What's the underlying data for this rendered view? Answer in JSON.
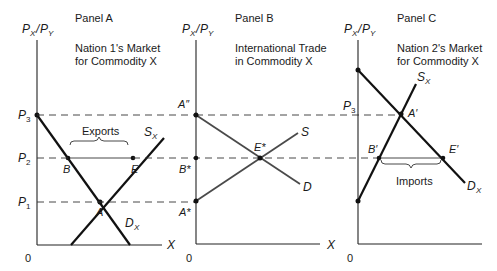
{
  "panels": [
    {
      "id": "A",
      "label": "Panel A",
      "title_line1": "Nation 1's Market",
      "title_line2": "for Commodity X",
      "y_axis_label": "PX/PY",
      "x_axis_label": "X",
      "origin": "0",
      "price_labels": [
        "P3",
        "P2",
        "P1"
      ],
      "points": [
        "B",
        "E",
        "A"
      ],
      "curves": [
        "SX",
        "DX"
      ],
      "bracket_label": "Exports"
    },
    {
      "id": "B",
      "label": "Panel B",
      "title_line1": "International Trade",
      "title_line2": "in Commodity X",
      "y_axis_label": "PX/PY",
      "x_axis_label": "X",
      "origin": "0",
      "price_labels": [
        "A″",
        "B*",
        "A*"
      ],
      "points": [
        "E*"
      ],
      "curves": [
        "S",
        "D"
      ]
    },
    {
      "id": "C",
      "label": "Panel C",
      "title_line1": "Nation 2's Market",
      "title_line2": "for Commodity X",
      "y_axis_label": "PX/PY",
      "x_axis_label": "X",
      "origin": "0",
      "price_labels": [
        "P3"
      ],
      "points": [
        "A′",
        "B′",
        "E′"
      ],
      "curves": [
        "SX",
        "DX"
      ],
      "bracket_label": "Imports"
    }
  ],
  "labels": {
    "panelA": "Panel A",
    "panelB": "Panel B",
    "panelC": "Panel C",
    "a_t1": "Nation 1's Market",
    "a_t2": "for Commodity X",
    "b_t1": "International Trade",
    "b_t2": "in Commodity X",
    "c_t1": "Nation 2's Market",
    "c_t2": "for Commodity X",
    "P": "P",
    "X": "X",
    "Y": "Y",
    "slash": "/",
    "zero": "0",
    "sub1": "1",
    "sub2": "2",
    "sub3": "3",
    "A": "A",
    "B": "B",
    "E": "E",
    "S": "S",
    "D": "D",
    "A_dd": "A″",
    "B_star": "B*",
    "A_star": "A*",
    "E_star": "E*",
    "A_prime": "A′",
    "B_prime": "B′",
    "E_prime": "E′",
    "exports": "Exports",
    "imports": "Imports"
  }
}
